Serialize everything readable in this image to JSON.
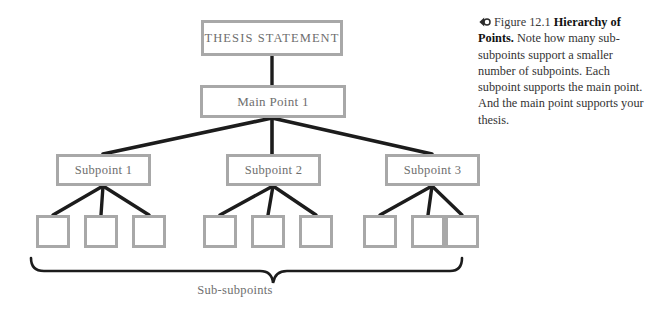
{
  "figure": {
    "diagram_title": "Hierarchy of Points diagram",
    "nodes": {
      "thesis": "THESIS STATEMENT",
      "main_point_1": "Main Point 1",
      "subpoints": [
        "Subpoint 1",
        "Subpoint 2",
        "Subpoint 3"
      ],
      "sub_subpoints": [
        "",
        "",
        "",
        "",
        "",
        "",
        "",
        "",
        ""
      ]
    },
    "brace_label": "Sub-subpoints"
  },
  "caption": {
    "icon": "audio-marker-icon",
    "figure_number": "Figure 12.1",
    "title": "Hierarchy of Points.",
    "body": " Note how many sub-subpoints support a smaller number of subpoints. Each subpoint supports the main point. And the main point supports your thesis."
  },
  "colors": {
    "box_border": "#a8a8a8",
    "box_fill": "#ffffff",
    "node_text": "#6e6e6e",
    "connector": "#1c1c1c",
    "brace": "#1c1c1c",
    "caption_title": "#111111",
    "caption_body": "#333333",
    "page_background": "#ffffff"
  }
}
